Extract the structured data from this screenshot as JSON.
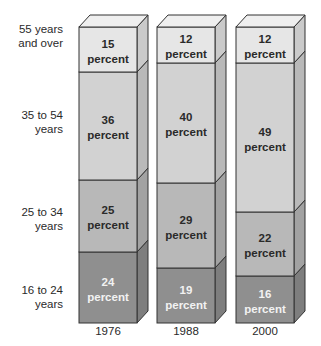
{
  "chart_data": {
    "type": "bar",
    "stacked": true,
    "style": "3d-stacked-100-percent",
    "title": "",
    "xlabel": "",
    "ylabel": "",
    "categories": [
      "1976",
      "1988",
      "2000"
    ],
    "series": [
      {
        "name": "16 to 24 years",
        "values": [
          24,
          19,
          16
        ],
        "color": "#8f8f8f",
        "text_color": "#f2f2f2"
      },
      {
        "name": "25 to 34 years",
        "values": [
          25,
          29,
          22
        ],
        "color": "#b8b8b8",
        "text_color": "#2a2a2a"
      },
      {
        "name": "35 to 54 years",
        "values": [
          36,
          40,
          49
        ],
        "color": "#d2d2d2",
        "text_color": "#2a2a2a"
      },
      {
        "name": "55 years and over",
        "values": [
          15,
          12,
          12
        ],
        "color": "#e6e6e6",
        "text_color": "#2a2a2a"
      }
    ],
    "value_suffix": "percent",
    "ylim": [
      0,
      100
    ]
  },
  "labels": {
    "rows": [
      {
        "text": "55 years\nand over",
        "top": 22
      },
      {
        "text": "35 to 54\nyears",
        "top": 108
      },
      {
        "text": "25 to 34\nyears",
        "top": 205
      },
      {
        "text": "16 to 24\nyears",
        "top": 283
      }
    ],
    "years": [
      "1976",
      "1988",
      "2000"
    ]
  },
  "segment_boxes": {
    "1976": [
      [
        252,
        323
      ],
      [
        180,
        252
      ],
      [
        72,
        180
      ],
      [
        27,
        72
      ]
    ],
    "1988": [
      [
        268,
        323
      ],
      [
        183,
        268
      ],
      [
        63,
        183
      ],
      [
        27,
        63
      ]
    ],
    "2000": [
      [
        276,
        323
      ],
      [
        212,
        276
      ],
      [
        63,
        212
      ],
      [
        27,
        63
      ]
    ]
  }
}
